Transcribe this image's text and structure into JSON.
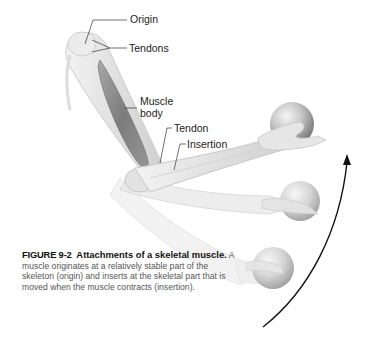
{
  "figure": {
    "number": "FIGURE 9-2",
    "title_line1": "Attachments of",
    "title_line2": "a skeletal muscle.",
    "caption_text": "A muscle originates at a relatively stable part of the skeleton (origin) and inserts at the skeletal part that is moved when the muscle contracts (insertion)."
  },
  "labels": {
    "origin": "Origin",
    "tendons": "Tendons",
    "muscle_body_1": "Muscle",
    "muscle_body_2": "body",
    "tendon": "Tendon",
    "insertion": "Insertion"
  },
  "colors": {
    "bone": "#e4e4e4",
    "muscle": "#8a8a8a",
    "ball_highlight": "#f2f2f2",
    "ball_shadow": "#6e6e6e",
    "arrow": "#111111",
    "leader_line": "#333333"
  }
}
